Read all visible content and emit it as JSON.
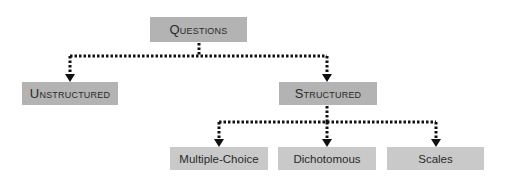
{
  "diagram": {
    "title": "Questions",
    "nodes": {
      "root": {
        "label": "Questions"
      },
      "unstructured": {
        "label": "Unstructured"
      },
      "structured": {
        "label": "Structured"
      },
      "multiple_choice": {
        "label": "Multiple-Choice"
      },
      "dichotomous": {
        "label": "Dichotomous"
      },
      "scales": {
        "label": "Scales"
      }
    },
    "edges": [
      {
        "from": "Questions",
        "to": "Unstructured"
      },
      {
        "from": "Questions",
        "to": "Structured"
      },
      {
        "from": "Structured",
        "to": "Multiple-Choice"
      },
      {
        "from": "Structured",
        "to": "Dichotomous"
      },
      {
        "from": "Structured",
        "to": "Scales"
      }
    ],
    "colors": {
      "primary_box": "#b3b3b3",
      "secondary_box": "#c9c9c9",
      "connector": "#111111"
    }
  }
}
